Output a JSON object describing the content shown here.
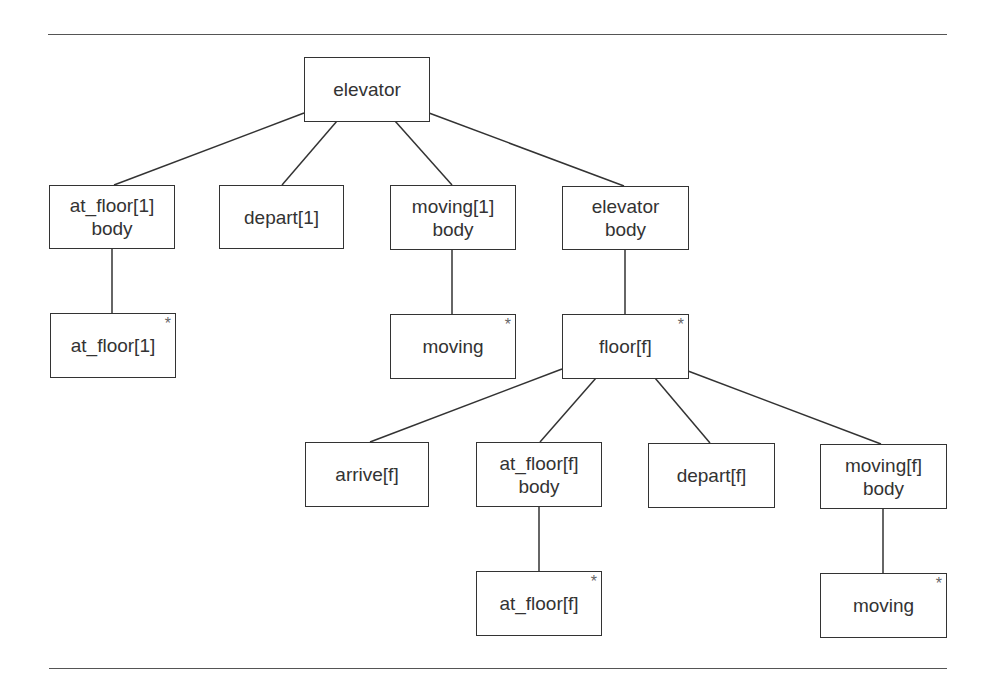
{
  "diagram": {
    "type": "tree",
    "root": "elevator",
    "nodes": [
      {
        "id": "elevator",
        "lines": [
          "elevator"
        ],
        "repeated": false,
        "parent": null
      },
      {
        "id": "at_floor1_body",
        "lines": [
          "at_floor[1]",
          "body"
        ],
        "repeated": false,
        "parent": "elevator"
      },
      {
        "id": "depart1",
        "lines": [
          "depart[1]"
        ],
        "repeated": false,
        "parent": "elevator"
      },
      {
        "id": "moving1_body",
        "lines": [
          "moving[1]",
          "body"
        ],
        "repeated": false,
        "parent": "elevator"
      },
      {
        "id": "elevator_body",
        "lines": [
          "elevator",
          "body"
        ],
        "repeated": false,
        "parent": "elevator"
      },
      {
        "id": "at_floor1",
        "lines": [
          "at_floor[1]"
        ],
        "repeated": true,
        "parent": "at_floor1_body"
      },
      {
        "id": "moving_a",
        "lines": [
          "moving"
        ],
        "repeated": true,
        "parent": "moving1_body"
      },
      {
        "id": "floor_f",
        "lines": [
          "floor[f]"
        ],
        "repeated": true,
        "parent": "elevator_body"
      },
      {
        "id": "arrive_f",
        "lines": [
          "arrive[f]"
        ],
        "repeated": false,
        "parent": "floor_f"
      },
      {
        "id": "at_floor_f_body",
        "lines": [
          "at_floor[f]",
          "body"
        ],
        "repeated": false,
        "parent": "floor_f"
      },
      {
        "id": "depart_f",
        "lines": [
          "depart[f]"
        ],
        "repeated": false,
        "parent": "floor_f"
      },
      {
        "id": "moving_f_body",
        "lines": [
          "moving[f]",
          "body"
        ],
        "repeated": false,
        "parent": "floor_f"
      },
      {
        "id": "at_floor_f",
        "lines": [
          "at_floor[f]"
        ],
        "repeated": true,
        "parent": "at_floor_f_body"
      },
      {
        "id": "moving_b",
        "lines": [
          "moving"
        ],
        "repeated": true,
        "parent": "moving_f_body"
      }
    ],
    "repeat_marker": "*"
  }
}
